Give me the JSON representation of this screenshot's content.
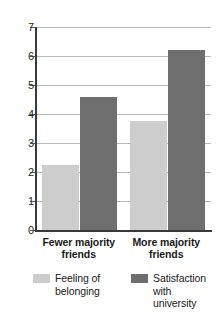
{
  "chart_data": {
    "type": "bar",
    "title": "",
    "xlabel": "",
    "ylabel": "",
    "ylim": [
      0,
      7
    ],
    "yticks": [
      "0",
      "1",
      "2",
      "3",
      "4",
      "5",
      "6",
      "7"
    ],
    "grid": true,
    "legend_position": "bottom",
    "categories": [
      "Fewer majority\nfriends",
      "More majority\nfriends"
    ],
    "category_lines": [
      [
        "Fewer majority",
        "friends"
      ],
      [
        "More majority",
        "friends"
      ]
    ],
    "series": [
      {
        "name": "Feeling of\nbelonging",
        "name_lines": [
          "Feeling of",
          "belonging"
        ],
        "color": "#cdcdcd",
        "values": [
          2.25,
          3.75
        ]
      },
      {
        "name": "Satisfaction\nwith university",
        "name_lines": [
          "Satisfaction",
          "with university"
        ],
        "color": "#6e6e6e",
        "values": [
          4.6,
          6.2
        ]
      }
    ]
  },
  "axis": {
    "line_color": "#3a3a3a",
    "grid_color": "#b9b9b9",
    "tick_color": "#5a5a5a"
  }
}
